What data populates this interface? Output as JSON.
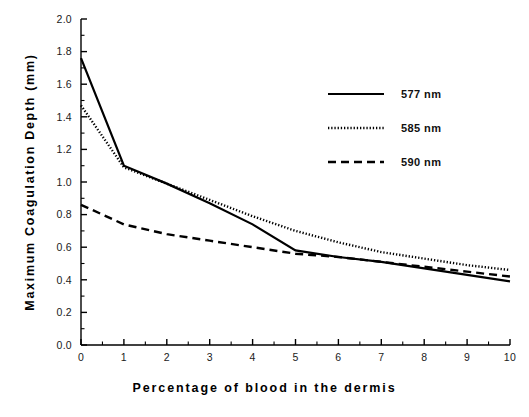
{
  "chart_data": {
    "type": "line",
    "title": "",
    "xlabel": "Percentage of blood in the dermis",
    "ylabel": "Maximum Coagulation Depth (mm)",
    "xlim": [
      0,
      10
    ],
    "ylim": [
      0.0,
      2.0
    ],
    "xticks": [
      0,
      1,
      2,
      3,
      4,
      5,
      6,
      7,
      8,
      9,
      10
    ],
    "xtick_labels": [
      "0",
      "1",
      "2",
      "3",
      "4",
      "5",
      "6",
      "7",
      "8",
      "9",
      "10"
    ],
    "x_minor_tick_interval": 0.5,
    "yticks": [
      0.0,
      0.2,
      0.4,
      0.6,
      0.8,
      1.0,
      1.2,
      1.4,
      1.6,
      1.8,
      2.0
    ],
    "ytick_labels": [
      "0.0",
      "0.2",
      "0.4",
      "0.6",
      "0.8",
      "1.0",
      "1.2",
      "1.4",
      "1.6",
      "1.8",
      "2.0"
    ],
    "y_minor_tick_interval": 0.1,
    "grid": false,
    "legend_position": "upper right",
    "axes_color": "#000000",
    "series": [
      {
        "name": "577 nm",
        "style": "solid",
        "color": "#000000",
        "x": [
          0,
          1,
          2,
          3,
          4,
          5,
          6,
          7,
          8,
          9,
          10
        ],
        "values": [
          1.76,
          1.1,
          0.99,
          0.87,
          0.74,
          0.58,
          0.54,
          0.51,
          0.47,
          0.43,
          0.39
        ]
      },
      {
        "name": "585 nm",
        "style": "dotted",
        "color": "#000000",
        "x": [
          0,
          1,
          2,
          3,
          4,
          5,
          6,
          7,
          8,
          9,
          10
        ],
        "values": [
          1.47,
          1.09,
          0.99,
          0.89,
          0.79,
          0.7,
          0.63,
          0.57,
          0.53,
          0.49,
          0.46
        ]
      },
      {
        "name": "590 nm",
        "style": "dashed",
        "color": "#000000",
        "x": [
          0,
          1,
          2,
          3,
          4,
          5,
          6,
          7,
          8,
          9,
          10
        ],
        "values": [
          0.86,
          0.74,
          0.68,
          0.64,
          0.6,
          0.56,
          0.54,
          0.51,
          0.48,
          0.45,
          0.42
        ]
      }
    ]
  },
  "legend": {
    "entries": [
      {
        "label": "577 nm",
        "style": "solid"
      },
      {
        "label": "585 nm",
        "style": "dotted"
      },
      {
        "label": "590 nm",
        "style": "dashed"
      }
    ]
  }
}
